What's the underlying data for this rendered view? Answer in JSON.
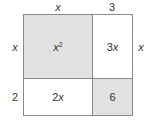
{
  "diagram": {
    "type": "area-model",
    "top_labels": [
      "x",
      "3"
    ],
    "left_labels": [
      "x",
      "2"
    ],
    "right_label": "x",
    "cells": [
      {
        "row": 0,
        "col": 0,
        "base": "x",
        "exp": "2",
        "shaded": true
      },
      {
        "row": 0,
        "col": 1,
        "text_num": "3",
        "text_var": "x",
        "shaded": false
      },
      {
        "row": 1,
        "col": 0,
        "text_num": "2",
        "text_var": "x",
        "shaded": false
      },
      {
        "row": 1,
        "col": 1,
        "text_num": "6",
        "text_var": "",
        "shaded": true
      }
    ],
    "colors": {
      "shade": "#e1e1e1",
      "border": "#8a8a8a",
      "text": "#333333"
    }
  }
}
